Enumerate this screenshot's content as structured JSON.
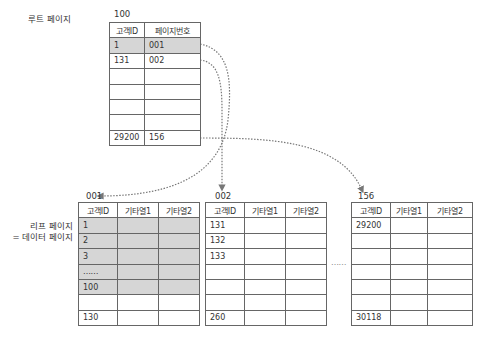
{
  "root": {
    "section_label": "루트 페이지",
    "page_number": "100",
    "columns": [
      "고객ID",
      "페이지번호"
    ],
    "rows": [
      [
        "1",
        "001"
      ],
      [
        "131",
        "002"
      ],
      [
        "",
        ""
      ],
      [
        "",
        ""
      ],
      [
        "",
        ""
      ],
      [
        "",
        ""
      ],
      [
        "29200",
        "156"
      ]
    ]
  },
  "leaf_section_label_line1": "리프 페이지",
  "leaf_section_label_line2": "= 데이터 페이지",
  "leaves": [
    {
      "page_number": "001",
      "columns": [
        "고객ID",
        "기타열1",
        "기타열2"
      ],
      "rows": [
        [
          "1",
          "",
          ""
        ],
        [
          "2",
          "",
          ""
        ],
        [
          "3",
          "",
          ""
        ],
        [
          "……",
          "",
          ""
        ],
        [
          "100",
          "",
          ""
        ],
        [
          "",
          "",
          ""
        ],
        [
          "130",
          "",
          ""
        ]
      ]
    },
    {
      "page_number": "002",
      "columns": [
        "고객ID",
        "기타열1",
        "기타열2"
      ],
      "rows": [
        [
          "131",
          "",
          ""
        ],
        [
          "132",
          "",
          ""
        ],
        [
          "133",
          "",
          ""
        ],
        [
          "",
          "",
          ""
        ],
        [
          "",
          "",
          ""
        ],
        [
          "",
          "",
          ""
        ],
        [
          "260",
          "",
          ""
        ]
      ]
    },
    {
      "page_number": "156",
      "columns": [
        "고객ID",
        "기타열1",
        "기타열2"
      ],
      "rows": [
        [
          "29200",
          "",
          ""
        ],
        [
          "",
          "",
          ""
        ],
        [
          "",
          "",
          ""
        ],
        [
          "",
          "",
          ""
        ],
        [
          "",
          "",
          ""
        ],
        [
          "",
          "",
          ""
        ],
        [
          "30118",
          "",
          ""
        ]
      ]
    }
  ],
  "ellipsis_between_leaves": "……",
  "colors": {
    "shade": "#d6d6d6",
    "border": "#444444",
    "arrow": "#777777"
  }
}
